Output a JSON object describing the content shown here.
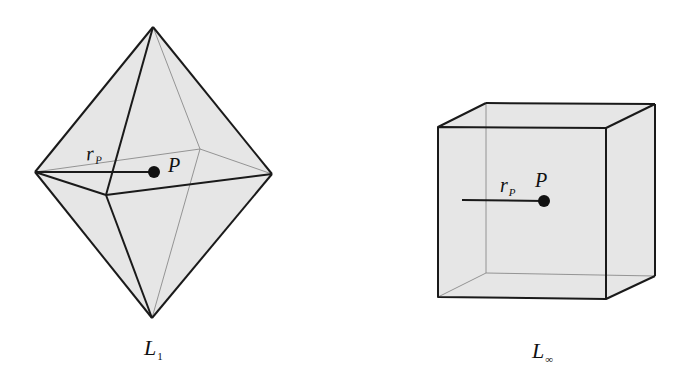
{
  "figure": {
    "panels": [
      {
        "id": "l1",
        "shape": "octahedron",
        "caption": {
          "main": "L",
          "sub": "1"
        },
        "point_label": "P",
        "radius_label": {
          "main": "r",
          "sub": "P"
        }
      },
      {
        "id": "linf",
        "shape": "cube",
        "caption": {
          "main": "L",
          "sub": "∞"
        },
        "point_label": "P",
        "radius_label": {
          "main": "r",
          "sub": "P"
        }
      }
    ],
    "colors": {
      "fill": "#e6e6e6",
      "edge": "#1a1a1a",
      "hidden_edge": "#8a8a8a",
      "background": "#ffffff"
    }
  }
}
